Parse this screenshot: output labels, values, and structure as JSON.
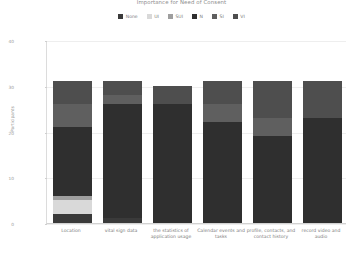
{
  "chart_data": {
    "type": "bar",
    "subtype": "stacked-bar",
    "title": "Importance for Need of Consent",
    "xlabel": "",
    "ylabel": "Participants",
    "ylim": [
      0,
      40
    ],
    "yticks": [
      0,
      10,
      20,
      30,
      40
    ],
    "grid": true,
    "legend_position": "top-center",
    "categories": [
      "Location",
      "vital sign data",
      "the statistics of application usage",
      "Calendar events and tasks",
      "profile, contacts, and contact history",
      "record video and audio"
    ],
    "series": [
      {
        "name": "None",
        "color": "#3a3a3a",
        "values": [
          2,
          1,
          0,
          0,
          0,
          0
        ]
      },
      {
        "name": "UI",
        "color": "#d9d9d9",
        "values": [
          3,
          0,
          0,
          0,
          0,
          0
        ]
      },
      {
        "name": "SUI",
        "color": "#9e9e9e",
        "values": [
          1,
          0,
          0,
          0,
          0,
          0
        ]
      },
      {
        "name": "N",
        "color": "#2f2f2f",
        "values": [
          15,
          25,
          26,
          22,
          19,
          23
        ]
      },
      {
        "name": "SI",
        "color": "#5f5f5f",
        "values": [
          5,
          2,
          0,
          4,
          4,
          0
        ]
      },
      {
        "name": "VI",
        "color": "#4e4e4e",
        "values": [
          5,
          3,
          4,
          5,
          8,
          8
        ]
      }
    ]
  },
  "axis": {
    "ytick_labels": [
      "0",
      "10",
      "20",
      "30",
      "40"
    ]
  }
}
